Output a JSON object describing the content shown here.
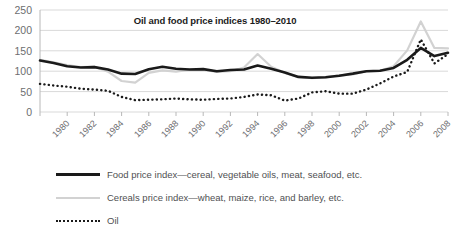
{
  "chart_data": {
    "type": "line",
    "title": "Oil and food price indices 1980–2010",
    "xlabel": "",
    "ylabel": "",
    "ylim": [
      0,
      250
    ],
    "yticks": [
      0,
      50,
      100,
      150,
      200,
      250
    ],
    "xlim": [
      1980,
      2010
    ],
    "xticks": [
      1980,
      1982,
      1984,
      1986,
      1988,
      1990,
      1992,
      1994,
      1996,
      1998,
      2000,
      2002,
      2004,
      2006,
      2008,
      2010
    ],
    "grid": true,
    "legend_position": "bottom-left",
    "x": [
      1980,
      1981,
      1982,
      1983,
      1984,
      1985,
      1986,
      1987,
      1988,
      1989,
      1990,
      1991,
      1992,
      1993,
      1994,
      1995,
      1996,
      1997,
      1998,
      1999,
      2000,
      2001,
      2002,
      2003,
      2004,
      2005,
      2006,
      2007,
      2008,
      2009,
      2010
    ],
    "series": [
      {
        "name": "Food price index—cereal, vegetable oils, meat, seafood, etc.",
        "short_name": "Food price index",
        "style": "solid-thick",
        "color": "#1a1a1a",
        "values": [
          126,
          120,
          112,
          109,
          110,
          104,
          94,
          93,
          105,
          111,
          106,
          104,
          105,
          100,
          103,
          104,
          114,
          106,
          97,
          86,
          84,
          85,
          89,
          94,
          100,
          101,
          108,
          128,
          157,
          137,
          145
        ]
      },
      {
        "name": "Cereals price index—wheat, maize,  rice, and barley, etc.",
        "short_name": "Cereals price index",
        "style": "solid-thin",
        "color": "#d2d2d2",
        "values": [
          128,
          122,
          115,
          110,
          111,
          99,
          76,
          72,
          96,
          102,
          99,
          104,
          104,
          98,
          100,
          109,
          142,
          111,
          96,
          86,
          83,
          85,
          90,
          92,
          100,
          101,
          112,
          151,
          222,
          157,
          156
        ]
      },
      {
        "name": "Oil",
        "short_name": "Oil",
        "style": "dotted",
        "color": "#1a1a1a",
        "values": [
          69,
          65,
          62,
          57,
          55,
          52,
          37,
          29,
          30,
          31,
          33,
          31,
          30,
          32,
          33,
          37,
          43,
          41,
          28,
          33,
          48,
          51,
          45,
          45,
          55,
          70,
          87,
          98,
          178,
          119,
          142
        ]
      }
    ]
  },
  "axis": {
    "ytick_labels": [
      "250",
      "200",
      "150",
      "100",
      "50",
      "0"
    ],
    "xtick_labels": [
      "1980",
      "1982",
      "1984",
      "1986",
      "1988",
      "1990",
      "1992",
      "1994",
      "1996",
      "1998",
      "2000",
      "2002",
      "2004",
      "2006",
      "2008",
      "2010"
    ]
  },
  "legend": {
    "items": [
      {
        "label": "Food price index—cereal, vegetable oils, meat, seafood, etc.",
        "key": "solid-thick-line-key"
      },
      {
        "label": "Cereals price index—wheat, maize,  rice, and barley, etc.",
        "key": "solid-thin-line-key"
      },
      {
        "label": "Oil",
        "key": "dotted-line-key"
      }
    ]
  },
  "colors": {
    "food_line": "#1a1a1a",
    "cereals_line": "#d2d2d2",
    "oil_line": "#1a1a1a",
    "grid": "#d9d9d9",
    "text": "#6d6e70"
  }
}
